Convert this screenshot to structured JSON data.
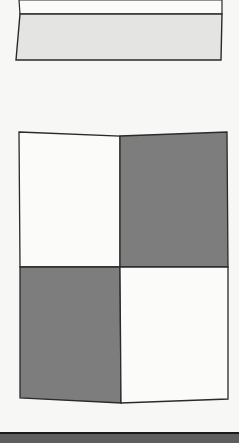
{
  "page": {
    "width": 239,
    "height": 443,
    "background": "#f7f7f5"
  },
  "colors": {
    "stroke": "#2a2a2a",
    "light_fill": "#e4e4e2",
    "dark_fill": "#7d7d7d",
    "white_fill": "#fbfbfa",
    "bottom_bar": "#5e5e5e"
  },
  "figures": [
    {
      "id": "top-strip",
      "description": "Rectangle split into a white upper band and a light gray lower band",
      "regions": [
        {
          "name": "upper-white",
          "fill": "white"
        },
        {
          "name": "lower-light-gray",
          "fill": "light-gray"
        }
      ]
    },
    {
      "id": "checker-grid",
      "description": "2x2 grid with diagonal dark shading",
      "rows": 2,
      "cols": 2,
      "cells": [
        {
          "row": 0,
          "col": 0,
          "fill": "white"
        },
        {
          "row": 0,
          "col": 1,
          "fill": "dark-gray"
        },
        {
          "row": 1,
          "col": 0,
          "fill": "dark-gray"
        },
        {
          "row": 1,
          "col": 1,
          "fill": "white"
        }
      ]
    }
  ]
}
